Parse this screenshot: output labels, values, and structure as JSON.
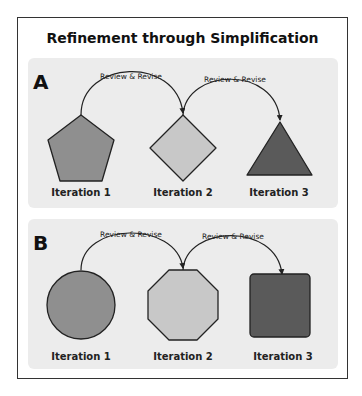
{
  "title": "Refinement through Simplification",
  "colors": {
    "panel_bg": "#ececec",
    "shape_mid": "#8f8f8f",
    "shape_light": "#c8c8c8",
    "shape_dark": "#5a5a5a",
    "stroke": "#222222"
  },
  "panels": [
    {
      "label": "A",
      "arrows": [
        {
          "label": "Review & Revise"
        },
        {
          "label": "Review & Revise"
        }
      ],
      "iterations": [
        {
          "label": "Iteration 1",
          "shape": "pentagon"
        },
        {
          "label": "Iteration 2",
          "shape": "diamond"
        },
        {
          "label": "Iteration 3",
          "shape": "triangle"
        }
      ]
    },
    {
      "label": "B",
      "arrows": [
        {
          "label": "Review & Revise"
        },
        {
          "label": "Review & Revise"
        }
      ],
      "iterations": [
        {
          "label": "Iteration 1",
          "shape": "circle"
        },
        {
          "label": "Iteration 2",
          "shape": "octagon"
        },
        {
          "label": "Iteration 3",
          "shape": "square"
        }
      ]
    }
  ]
}
